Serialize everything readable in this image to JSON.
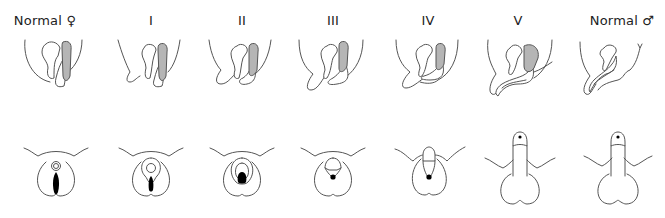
{
  "diagram": {
    "type": "staging-illustration",
    "rows": [
      "sagittal-view",
      "external-genitalia-view"
    ],
    "stages": [
      {
        "label": "Normal ♀",
        "id": "normal-female",
        "x": 45
      },
      {
        "label": "I",
        "id": "stage-1",
        "x": 151
      },
      {
        "label": "II",
        "id": "stage-2",
        "x": 242
      },
      {
        "label": "III",
        "id": "stage-3",
        "x": 333
      },
      {
        "label": "IV",
        "id": "stage-4",
        "x": 428
      },
      {
        "label": "V",
        "id": "stage-5",
        "x": 518
      },
      {
        "label": "Normal ♂",
        "id": "normal-male",
        "x": 622
      }
    ],
    "colors": {
      "line": "#555555",
      "shaded_organ": "#b5b5b5",
      "opening": "#000000",
      "background": "#ffffff"
    }
  }
}
